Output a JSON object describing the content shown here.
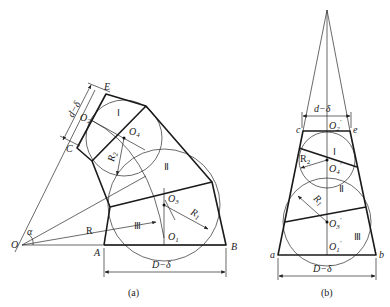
{
  "figure": {
    "type": "technical drawing",
    "panels": [
      {
        "id": "a",
        "caption": "(a)",
        "points": {
          "O": "O",
          "A": "A",
          "B": "B",
          "C": "C",
          "E": "E",
          "O1": "O",
          "O2": "O",
          "O3": "O",
          "O4": "O"
        },
        "point_subscripts": {
          "O1": "1",
          "O2": "2",
          "O3": "3",
          "O4": "4"
        },
        "sections": {
          "s1": "Ⅰ",
          "s2": "Ⅱ",
          "s3": "Ⅲ"
        },
        "dimensions": {
          "top": "d−δ",
          "bottom": "D−δ",
          "radius_main": "R",
          "radius_1": "R",
          "radius_1_sub": "1",
          "radius_2": "R",
          "radius_2_sub": "2",
          "angle": "α"
        }
      },
      {
        "id": "b",
        "caption": "(b)",
        "points": {
          "a": "a",
          "b": "b",
          "c": "c",
          "e": "e",
          "O1p": "O",
          "O2p": "O",
          "O3p": "O",
          "O4p": "O"
        },
        "point_subscripts": {
          "O1p": "1",
          "O2p": "2",
          "O3p": "3",
          "O4p": "4"
        },
        "prime": "′",
        "sections": {
          "s1": "Ⅰ",
          "s2": "Ⅱ",
          "s3": "Ⅲ"
        },
        "dimensions": {
          "top": "d−δ",
          "bottom": "D−δ",
          "radius_1": "R",
          "radius_1_sub": "1",
          "radius_2": "R",
          "radius_2_sub": "2"
        }
      }
    ]
  },
  "colors": {
    "line": "#1a1a1a",
    "background": "#ffffff"
  }
}
